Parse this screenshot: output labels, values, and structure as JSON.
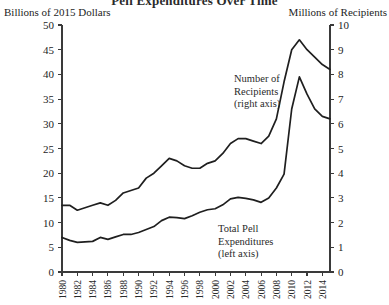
{
  "chart_data": {
    "type": "line",
    "title": "Pell Expenditures Over Time",
    "xlabel": "",
    "ylabel": "Billions of 2015 Dollars",
    "y2label": "Millions of Recipients",
    "grid": false,
    "legend_position": "inline-annotations",
    "xlim": [
      1980,
      2015
    ],
    "ylim": [
      0,
      50
    ],
    "y2lim": [
      0,
      10
    ],
    "yticks": [
      0,
      5,
      10,
      15,
      20,
      25,
      30,
      35,
      40,
      45,
      50
    ],
    "y2ticks": [
      0,
      1,
      2,
      3,
      4,
      5,
      6,
      7,
      8,
      9,
      10
    ],
    "xticks": [
      1980,
      1982,
      1984,
      1986,
      1988,
      1990,
      1992,
      1994,
      1996,
      1998,
      2000,
      2002,
      2004,
      2006,
      2008,
      2010,
      2012,
      2014
    ],
    "x": [
      1980,
      1981,
      1982,
      1983,
      1984,
      1985,
      1986,
      1987,
      1988,
      1989,
      1990,
      1991,
      1992,
      1993,
      1994,
      1995,
      1996,
      1997,
      1998,
      1999,
      2000,
      2001,
      2002,
      2003,
      2004,
      2005,
      2006,
      2007,
      2008,
      2009,
      2010,
      2011,
      2012,
      2013,
      2014,
      2015
    ],
    "series": [
      {
        "name": "Total Pell Expenditures (left axis)",
        "axis": "left",
        "units": "Billions of 2015 Dollars",
        "values": [
          7.0,
          6.4,
          6.0,
          6.1,
          6.2,
          7.0,
          6.6,
          7.1,
          7.6,
          7.6,
          8.0,
          8.6,
          9.2,
          10.4,
          11.1,
          11.0,
          10.8,
          11.4,
          12.1,
          12.6,
          12.8,
          13.6,
          14.8,
          15.1,
          14.9,
          14.6,
          14.1,
          15.0,
          17.0,
          19.8,
          33.0,
          39.5,
          36.0,
          33.0,
          31.5,
          31.0
        ]
      },
      {
        "name": "Number of Recipients (right axis)",
        "axis": "right",
        "units": "Millions of Recipients",
        "values": [
          2.7,
          2.7,
          2.5,
          2.6,
          2.7,
          2.8,
          2.7,
          2.9,
          3.2,
          3.3,
          3.4,
          3.8,
          4.0,
          4.3,
          4.6,
          4.5,
          4.3,
          4.2,
          4.2,
          4.4,
          4.5,
          4.8,
          5.2,
          5.4,
          5.4,
          5.3,
          5.2,
          5.5,
          6.2,
          7.7,
          9.0,
          9.4,
          9.0,
          8.7,
          8.4,
          8.2
        ]
      }
    ],
    "annotations": [
      {
        "id": "recipients-annotation",
        "lines": [
          "Number of",
          "Recipients",
          "(right axis)"
        ]
      },
      {
        "id": "expenditures-annotation",
        "lines": [
          "Total Pell",
          "Expenditures",
          "(left axis)"
        ]
      }
    ]
  }
}
